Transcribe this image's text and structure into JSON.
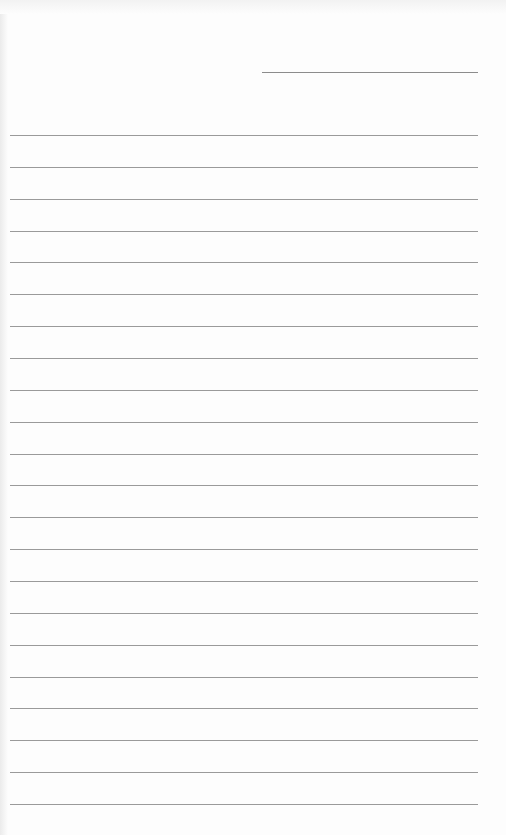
{
  "page": {
    "type": "lined-paper",
    "header_line": {
      "label": "date/title line"
    },
    "ruled_line_count": 22,
    "line_color": "#9a9a9a",
    "paper_color": "#fdfdfd"
  }
}
